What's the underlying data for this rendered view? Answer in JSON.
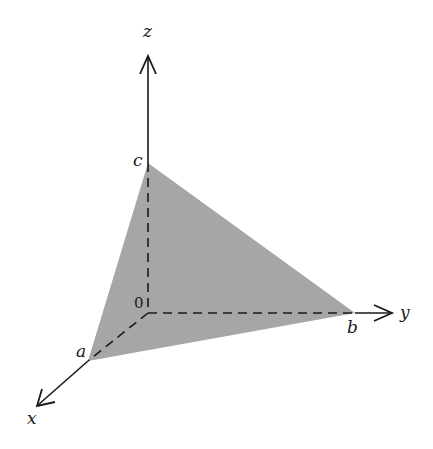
{
  "diagram": {
    "colors": {
      "fill": "#a6a6a6",
      "line": "#1a1a1a",
      "background": "#ffffff"
    },
    "axes": {
      "x": {
        "label": "x"
      },
      "y": {
        "label": "y"
      },
      "z": {
        "label": "z"
      }
    },
    "origin_label": "0",
    "intercepts": {
      "a": "a",
      "b": "b",
      "c": "c"
    }
  }
}
